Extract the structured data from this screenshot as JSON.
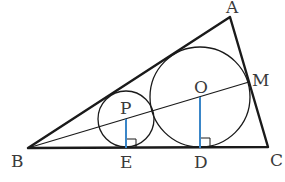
{
  "diagram": {
    "type": "geometry",
    "colors": {
      "stroke": "#1a1a1a",
      "perpendicular": "#3a86c8",
      "label": "#3a3a3a"
    },
    "points": {
      "A": {
        "label": "A",
        "x": 230,
        "y": 17
      },
      "B": {
        "label": "B",
        "x": 28,
        "y": 148
      },
      "C": {
        "label": "C",
        "x": 268,
        "y": 147
      },
      "M": {
        "label": "M",
        "x": 249,
        "y": 82
      },
      "P": {
        "label": "P",
        "x": 126,
        "y": 119
      },
      "O": {
        "label": "O",
        "x": 200,
        "y": 97
      },
      "E": {
        "label": "E",
        "x": 126,
        "y": 148
      },
      "D": {
        "label": "D",
        "x": 200,
        "y": 148
      }
    },
    "circles": [
      {
        "name": "circle-P",
        "center": "P",
        "r": 28
      },
      {
        "name": "circle-O",
        "center": "O",
        "r": 50
      }
    ],
    "segments": [
      {
        "from": "A",
        "to": "B"
      },
      {
        "from": "B",
        "to": "C"
      },
      {
        "from": "C",
        "to": "A"
      },
      {
        "from": "B",
        "to": "M"
      },
      {
        "from": "P",
        "to": "E",
        "color": "perpendicular"
      },
      {
        "from": "O",
        "to": "D",
        "color": "perpendicular"
      }
    ],
    "right_angle_marks": [
      "E",
      "D"
    ]
  }
}
